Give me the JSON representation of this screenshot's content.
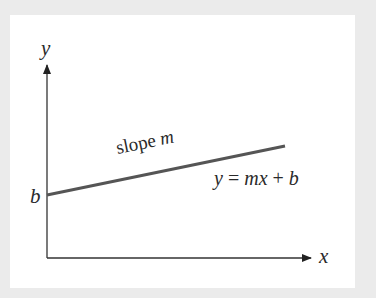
{
  "diagram": {
    "type": "linear-function-graph",
    "background_color": "#ebebeb",
    "panel_color": "#ffffff",
    "axis_color": "#333333",
    "line_color": "#555555",
    "labels": {
      "y_axis": "y",
      "x_axis": "x",
      "intercept": "b",
      "slope_word": "slope",
      "slope_symbol": "m",
      "equation": {
        "lhs": "y",
        "eq": " = ",
        "m": "m",
        "x": "x",
        "plus": " + ",
        "b": "b"
      }
    },
    "geometry": {
      "origin": [
        47,
        258
      ],
      "y_axis_top": [
        47,
        63
      ],
      "x_axis_right": [
        313,
        258
      ],
      "line_start": [
        47,
        195
      ],
      "line_end": [
        285,
        146
      ]
    }
  }
}
